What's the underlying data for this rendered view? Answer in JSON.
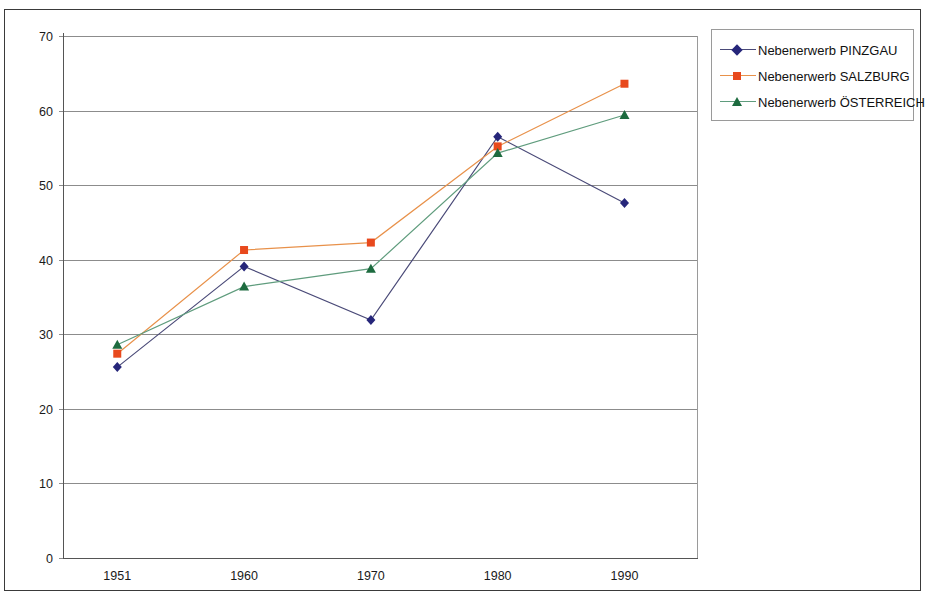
{
  "page": {
    "cropped_title_fragment": ""
  },
  "legend": {
    "position": "top-right",
    "entries": [
      {
        "label": "Nebenerwerb  PINZGAU",
        "color": "#26267a",
        "marker": "diamond",
        "marker_name": "legend-marker-diamond"
      },
      {
        "label": "Nebenerwerb  SALZBURG",
        "color": "#e8491d",
        "marker": "square",
        "marker_name": "legend-marker-square"
      },
      {
        "label": "Nebenerwerb  ÖSTERREICH",
        "color": "#1d6b3f",
        "marker": "triangle",
        "marker_name": "legend-marker-triangle"
      }
    ]
  },
  "chart_data": {
    "type": "line",
    "title": "",
    "xlabel": "",
    "ylabel": "",
    "categories": [
      "1951",
      "1960",
      "1970",
      "1980",
      "1990"
    ],
    "x_tick_labels": [
      "1951",
      "1960",
      "1970",
      "1980",
      "1990"
    ],
    "y_tick_labels": [
      "0",
      "10",
      "20",
      "30",
      "40",
      "50",
      "60",
      "70"
    ],
    "ylim": [
      0,
      70
    ],
    "y_tick_step": 10,
    "grid": "horizontal",
    "legend_position": "top-right",
    "series": [
      {
        "name": "Nebenerwerb  PINZGAU",
        "color": "#26267a",
        "line_color": "#4a4a78",
        "marker": "diamond",
        "values": [
          25.6,
          39.1,
          31.9,
          56.5,
          47.6
        ]
      },
      {
        "name": "Nebenerwerb  SALZBURG",
        "color": "#e8491d",
        "line_color": "#e8914a",
        "marker": "square",
        "values": [
          27.4,
          41.3,
          42.3,
          55.2,
          63.6
        ]
      },
      {
        "name": "Nebenerwerb  ÖSTERREICH",
        "color": "#1d6b3f",
        "line_color": "#5f9c7d",
        "marker": "triangle",
        "values": [
          28.6,
          36.4,
          38.8,
          54.3,
          59.4
        ]
      }
    ]
  }
}
